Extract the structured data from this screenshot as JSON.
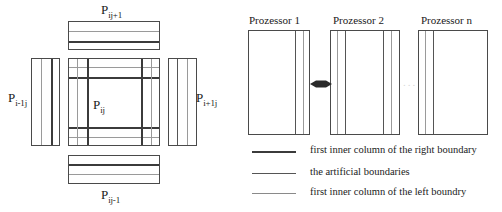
{
  "figure": {
    "type": "diagram"
  },
  "stencil": {
    "center_label": {
      "base": "P",
      "sub": "ij"
    },
    "top_label": {
      "base": "P",
      "sub": "ij+1"
    },
    "bottom_label": {
      "base": "P",
      "sub": "ij-1"
    },
    "left_label": {
      "base": "P",
      "sub": "i-1j"
    },
    "right_label": {
      "base": "P",
      "sub": "i+1j"
    }
  },
  "processors": {
    "items": [
      {
        "title": "Prozessor 1"
      },
      {
        "title": "Prozessor 2"
      },
      {
        "title": "Prozessor n"
      }
    ],
    "exchange_arrow": "double-headed-arrow",
    "ellipsis": "..."
  },
  "legend": {
    "items": [
      {
        "label": "first inner column of the right boundary",
        "color": "#3b3b3b",
        "weight": "2px"
      },
      {
        "label": "the artificial boundaries",
        "color": "#555555",
        "weight": "1.6px"
      },
      {
        "label": "first inner column of the left boundry",
        "color": "#8a8a8a",
        "weight": "1.2px"
      }
    ]
  },
  "colors": {
    "dark_line": "#3b3b3b",
    "mid_line": "#555555",
    "light_line": "#9a9a9a",
    "box_border": "#4a4a4a",
    "background": "#ffffff"
  }
}
